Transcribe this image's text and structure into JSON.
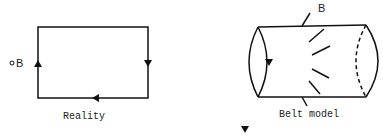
{
  "left_figure": {
    "caption": "Reality",
    "point_label": "B",
    "point_marker": "°"
  },
  "right_figure": {
    "caption": "Belt model",
    "label": "B"
  },
  "colors": {
    "ink": "#111111",
    "background": "#ffffff"
  }
}
